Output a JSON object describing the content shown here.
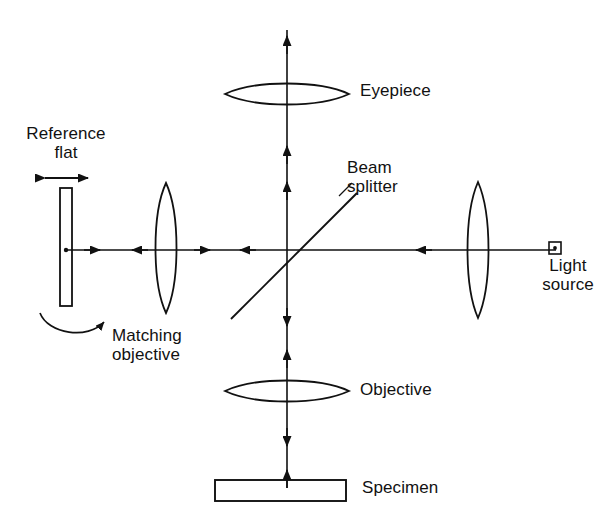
{
  "figure": {
    "background_color": "#ffffff",
    "stroke_color": "#111111",
    "width": 606,
    "height": 522
  },
  "labels": {
    "reference_flat": "Reference\nflat",
    "matching_objective": "Matching\nobjective",
    "beam_splitter": "Beam\nsplitter",
    "eyepiece": "Eyepiece",
    "objective": "Objective",
    "specimen": "Specimen",
    "light_source": "Light\nsource"
  },
  "components": [
    {
      "name": "reference-flat",
      "type": "flat-mirror",
      "shape": "rectangle",
      "x": 60,
      "y": 188,
      "width": 12,
      "height": 118,
      "label": "Reference flat"
    },
    {
      "name": "translation-arrow",
      "type": "double-headed-arrow",
      "orientation": "horizontal",
      "x1": 38,
      "x2": 94,
      "y": 178,
      "meaning": "reference flat translation"
    },
    {
      "name": "rotation-arrow",
      "type": "curved-arrow",
      "orientation": "counterclockwise-sweep",
      "meaning": "reference flat tilt adjustment"
    },
    {
      "name": "matching-objective",
      "type": "lens",
      "shape": "biconvex-vertical",
      "cx": 166,
      "cy": 248,
      "semi_height": 65,
      "semi_width": 13,
      "label": "Matching objective"
    },
    {
      "name": "beam-splitter",
      "type": "beam-splitter",
      "shape": "diagonal-line",
      "x1": 232,
      "y1": 318,
      "x2": 356,
      "y2": 194,
      "angle_degrees": 45,
      "label": "Beam splitter"
    },
    {
      "name": "eyepiece",
      "type": "lens",
      "shape": "biconvex-horizontal",
      "cx": 287,
      "cy": 94,
      "semi_width": 62,
      "semi_height": 11,
      "label": "Eyepiece"
    },
    {
      "name": "objective",
      "type": "lens",
      "shape": "biconvex-horizontal",
      "cx": 287,
      "cy": 391,
      "semi_width": 62,
      "semi_height": 11,
      "label": "Objective"
    },
    {
      "name": "specimen",
      "type": "sample",
      "shape": "rectangle",
      "x": 215,
      "y": 480,
      "width": 131,
      "height": 21,
      "label": "Specimen"
    },
    {
      "name": "condenser-lens",
      "type": "lens",
      "shape": "biconvex-vertical",
      "cx": 478,
      "cy": 250,
      "semi_height": 68,
      "semi_width": 13
    },
    {
      "name": "light-source",
      "type": "source",
      "shape": "square-with-dot",
      "cx": 555,
      "cy": 248,
      "size": 11,
      "label": "Light source"
    }
  ],
  "axes": {
    "horizontal": {
      "y": 250,
      "x_start": 66,
      "x_end": 555,
      "description": "horizontal optical axis from reference flat to light source"
    },
    "vertical": {
      "x": 287,
      "y_top": 28,
      "y_bottom": 490,
      "description": "vertical optical axis from eyepiece to specimen"
    }
  },
  "ray_arrows": [
    {
      "name": "ray-left-outbound",
      "x": 97,
      "y": 250,
      "direction": "left-to-right"
    },
    {
      "name": "ray-left-inbound",
      "x": 139,
      "y": 250,
      "direction": "right-to-left"
    },
    {
      "name": "ray-mid-outbound",
      "x": 207,
      "y": 250,
      "direction": "left-to-right"
    },
    {
      "name": "ray-mid-inbound",
      "x": 247,
      "y": 250,
      "direction": "right-to-left"
    },
    {
      "name": "ray-right-inbound",
      "x": 422,
      "y": 250,
      "direction": "right-to-left"
    },
    {
      "name": "ray-up-top",
      "x": 287,
      "y": 40,
      "direction": "upward"
    },
    {
      "name": "ray-up-mid",
      "x": 287,
      "y": 150,
      "direction": "upward"
    },
    {
      "name": "ray-up-low",
      "x": 287,
      "y": 186,
      "direction": "upward"
    },
    {
      "name": "ray-down-upper",
      "x": 287,
      "y": 324,
      "direction": "downward"
    },
    {
      "name": "ray-up-upper",
      "x": 287,
      "y": 352,
      "direction": "upward"
    },
    {
      "name": "ray-down-lower",
      "x": 287,
      "y": 444,
      "direction": "downward"
    },
    {
      "name": "ray-up-lower",
      "x": 287,
      "y": 472,
      "direction": "upward"
    }
  ]
}
